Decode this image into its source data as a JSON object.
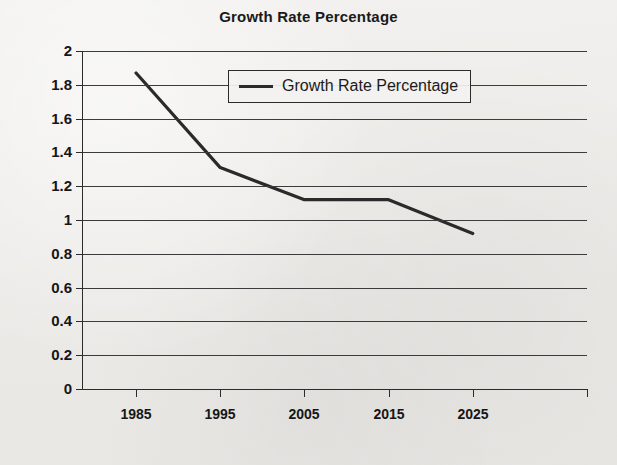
{
  "chart_data": {
    "type": "line",
    "title": "Growth Rate Percentage",
    "xlabel": "",
    "ylabel": "",
    "categories": [
      "1985",
      "1995",
      "2005",
      "2015",
      "2025"
    ],
    "series": [
      {
        "name": "Growth Rate Percentage",
        "values": [
          1.87,
          1.31,
          1.12,
          1.12,
          0.92
        ]
      }
    ],
    "ylim": [
      0,
      2
    ],
    "ytick_step": 0.2,
    "ytick_labels": [
      "2",
      "1.8",
      "1.6",
      "1.4",
      "1.2",
      "1",
      "0.8",
      "0.6",
      "0.4",
      "0.2",
      "0"
    ],
    "ytick_values": [
      2,
      1.8,
      1.6,
      1.4,
      1.2,
      1,
      0.8,
      0.6,
      0.4,
      0.2,
      0
    ],
    "grid": true,
    "grid_axis": "y",
    "legend": {
      "position": "top-center-inside",
      "entries": [
        {
          "label": "Growth Rate Percentage",
          "marker": "line-swatch"
        }
      ]
    },
    "line_color": "#2a2a2a",
    "line_width": 3.2,
    "background_color": "#efeeec"
  }
}
